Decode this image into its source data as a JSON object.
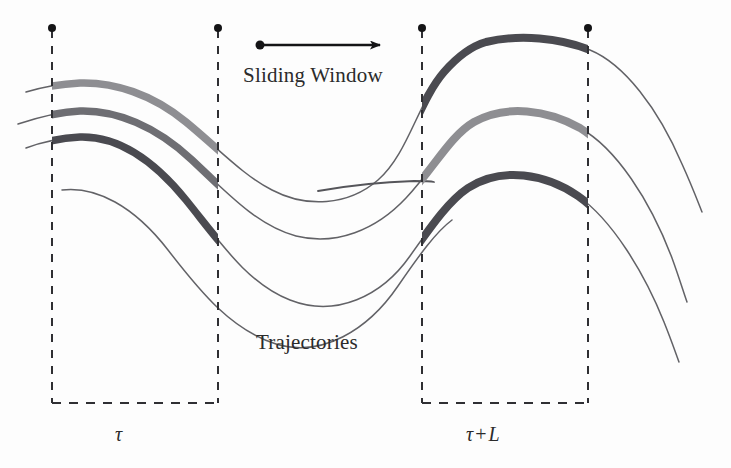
{
  "figure": {
    "background_color": "#fdfdfd",
    "width": 731,
    "height": 468,
    "labels": {
      "sliding_window": "Sliding Window",
      "trajectories": "Trajectories",
      "tau": "τ",
      "tau_plus_l": "τ + L",
      "tau_symbol": "τ",
      "plus_symbol": "+",
      "l_symbol": "L"
    },
    "colors": {
      "thin_curve": "#55555a",
      "thick_light": "#8e8e92",
      "thick_medium": "#6e6e73",
      "thick_dark": "#4a4a50",
      "dashed_line": "#2f2f33",
      "dot": "#141416",
      "arrow": "#141416",
      "text": "#2b2b2b"
    },
    "windows": [
      {
        "name": "tau",
        "x_start": 52,
        "x_end": 218,
        "label": "τ"
      },
      {
        "name": "tau-plus-L",
        "x_start": 422,
        "x_end": 588,
        "label": "τ + L"
      }
    ],
    "dashed_lines": [
      {
        "x": 52,
        "y_top": 28,
        "y_bottom": 403
      },
      {
        "x": 218,
        "y_top": 28,
        "y_bottom": 403
      },
      {
        "x": 422,
        "y_top": 28,
        "y_bottom": 403
      },
      {
        "x": 588,
        "y_top": 28,
        "y_bottom": 403
      }
    ],
    "window_dots": [
      {
        "x": 52,
        "y": 28
      },
      {
        "x": 218,
        "y": 28
      },
      {
        "x": 422,
        "y": 28
      },
      {
        "x": 588,
        "y": 28
      }
    ],
    "arrow": {
      "tail_x": 260,
      "tail_y": 45,
      "head_x": 392,
      "head_y": 45,
      "dot_radius": 4.5
    },
    "trajectories": [
      {
        "id": "trajectory-top",
        "thick_color": "#8e8e92",
        "thick_color_right": "#4a4a50",
        "path": "M 30 92 C 44 88, 60 85, 78 84 C 110 82, 150 92, 182 118 C 214 144, 236 170, 262 186 C 296 206, 340 208, 372 186 C 404 164, 412 110, 438 76 C 452 58, 468 46, 482 42",
        "left_thick_from": 52,
        "left_thick_to": 218,
        "right_thick_from": 422,
        "right_thick_to": 588
      },
      {
        "id": "trajectory-middle",
        "thick_color": "#6e6e73",
        "thick_color_right": "#8e8e92",
        "path": "M 22 124 C 38 118, 58 113, 78 112 C 112 110, 152 124, 186 156 C 220 188, 252 222, 290 232 C 330 242, 372 228, 402 196 C 430 166, 446 132, 470 118",
        "left_thick_from": 52,
        "left_thick_to": 218,
        "right_thick_from": 422,
        "right_thick_to": 588
      },
      {
        "id": "trajectory-bottom",
        "thick_color": "#4a4a50",
        "thick_color_right": "#4a4a50",
        "path": "M 30 148 C 44 142, 60 138, 78 137 C 112 136, 148 154, 180 194 C 212 234, 240 280, 282 296 C 328 314, 378 292, 406 252 C 428 220, 444 198, 462 186",
        "left_thick_from": 52,
        "left_thick_to": 218,
        "right_thick_from": 422,
        "right_thick_to": 588
      }
    ],
    "stub_segment": {
      "id": "trajectory-stub",
      "x_start": 318,
      "y_start": 190,
      "x_end": 430,
      "y_end": 183
    }
  }
}
